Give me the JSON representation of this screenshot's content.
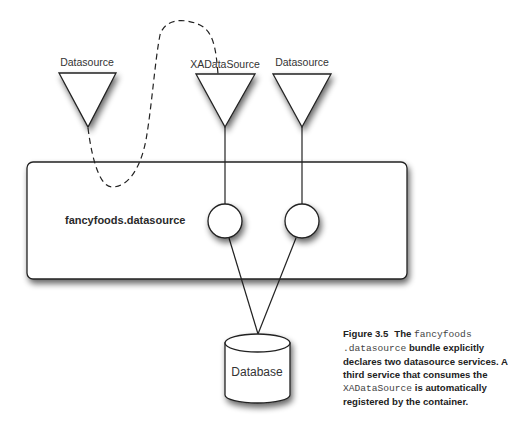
{
  "diagram": {
    "services": [
      {
        "label": "Datasource",
        "kind": "consumer"
      },
      {
        "label": "XADataSource",
        "kind": "service"
      },
      {
        "label": "Datasource",
        "kind": "service"
      }
    ],
    "bundle": {
      "label": "fancyfoods.datasource"
    },
    "database": {
      "label": "Database"
    },
    "connections": [
      {
        "from": "Datasource (left)",
        "to": "XADataSource",
        "style": "dashed"
      },
      {
        "from": "XADataSource",
        "to": "bundle circle 1",
        "style": "solid"
      },
      {
        "from": "Datasource (right)",
        "to": "bundle circle 2",
        "style": "solid"
      },
      {
        "from": "bundle circle 1",
        "to": "Database",
        "style": "solid"
      },
      {
        "from": "bundle circle 2",
        "to": "Database",
        "style": "solid"
      }
    ]
  },
  "caption": {
    "figure": "Figure 3.5",
    "part1": "The ",
    "code1": "fancyfoods",
    "code2": ".datasource",
    "part2": " bundle explicitly declares two datasource services. A third service that consumes the ",
    "code3": "XADataSource",
    "part3": " is automatically registered by the container."
  }
}
